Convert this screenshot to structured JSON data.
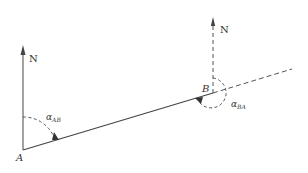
{
  "diagram": {
    "stroke_color": "#444444",
    "points": {
      "A": {
        "label": "A",
        "x": 23,
        "y": 150
      },
      "B": {
        "label": "B",
        "x": 213,
        "y": 93
      }
    },
    "north_labels": {
      "at_A": "N",
      "at_B": "N"
    },
    "angles": {
      "alpha_AB": {
        "symbol": "α",
        "subscript": "AB"
      },
      "alpha_BA": {
        "symbol": "α",
        "subscript": "BA"
      }
    }
  }
}
